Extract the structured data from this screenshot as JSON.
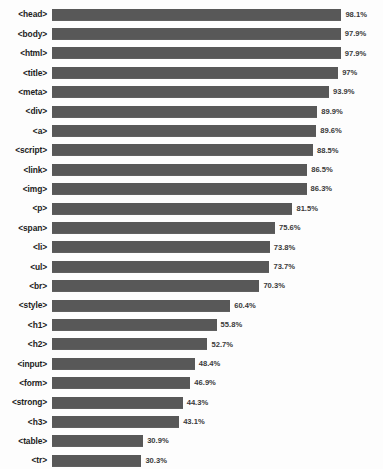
{
  "chart_data": {
    "type": "bar",
    "orientation": "horizontal",
    "title": "",
    "subtitle": "",
    "xlabel": "",
    "ylabel": "",
    "xlim": [
      0,
      100
    ],
    "grid": false,
    "legend": "none",
    "bar_color": "#585858",
    "background_color": "#fdfdfd",
    "value_suffix": "%",
    "categories": [
      "<head>",
      "<body>",
      "<html>",
      "<title>",
      "<meta>",
      "<div>",
      "<a>",
      "<script>",
      "<link>",
      "<img>",
      "<p>",
      "<span>",
      "<li>",
      "<ul>",
      "<br>",
      "<style>",
      "<h1>",
      "<h2>",
      "<input>",
      "<form>",
      "<strong>",
      "<h3>",
      "<table>",
      "<tr>",
      "<td>"
    ],
    "values": [
      98.1,
      97.9,
      97.9,
      97.0,
      93.9,
      89.9,
      89.6,
      88.5,
      86.5,
      86.3,
      81.5,
      75.6,
      73.8,
      73.7,
      70.3,
      60.4,
      55.8,
      52.7,
      48.4,
      46.9,
      44.3,
      43.1,
      30.9,
      30.3,
      30.2
    ],
    "value_labels": [
      "98.1%",
      "97.9%",
      "97.9%",
      "97%",
      "93.9%",
      "89.9%",
      "89.6%",
      "88.5%",
      "86.5%",
      "86.3%",
      "81.5%",
      "75.6%",
      "73.8%",
      "73.7%",
      "70.3%",
      "60.4%",
      "55.8%",
      "52.7%",
      "48.4%",
      "46.9%",
      "44.3%",
      "43.1%",
      "30.9%",
      "30.3%",
      "30.2%"
    ],
    "rows": [
      {
        "label": "<head>",
        "value": 98.1,
        "value_label": "98.1%"
      },
      {
        "label": "<body>",
        "value": 97.9,
        "value_label": "97.9%"
      },
      {
        "label": "<html>",
        "value": 97.9,
        "value_label": "97.9%"
      },
      {
        "label": "<title>",
        "value": 97.0,
        "value_label": "97%"
      },
      {
        "label": "<meta>",
        "value": 93.9,
        "value_label": "93.9%"
      },
      {
        "label": "<div>",
        "value": 89.9,
        "value_label": "89.9%"
      },
      {
        "label": "<a>",
        "value": 89.6,
        "value_label": "89.6%"
      },
      {
        "label": "<script>",
        "value": 88.5,
        "value_label": "88.5%"
      },
      {
        "label": "<link>",
        "value": 86.5,
        "value_label": "86.5%"
      },
      {
        "label": "<img>",
        "value": 86.3,
        "value_label": "86.3%"
      },
      {
        "label": "<p>",
        "value": 81.5,
        "value_label": "81.5%"
      },
      {
        "label": "<span>",
        "value": 75.6,
        "value_label": "75.6%"
      },
      {
        "label": "<li>",
        "value": 73.8,
        "value_label": "73.8%"
      },
      {
        "label": "<ul>",
        "value": 73.7,
        "value_label": "73.7%"
      },
      {
        "label": "<br>",
        "value": 70.3,
        "value_label": "70.3%"
      },
      {
        "label": "<style>",
        "value": 60.4,
        "value_label": "60.4%"
      },
      {
        "label": "<h1>",
        "value": 55.8,
        "value_label": "55.8%"
      },
      {
        "label": "<h2>",
        "value": 52.7,
        "value_label": "52.7%"
      },
      {
        "label": "<input>",
        "value": 48.4,
        "value_label": "48.4%"
      },
      {
        "label": "<form>",
        "value": 46.9,
        "value_label": "46.9%"
      },
      {
        "label": "<strong>",
        "value": 44.3,
        "value_label": "44.3%"
      },
      {
        "label": "<h3>",
        "value": 43.1,
        "value_label": "43.1%"
      },
      {
        "label": "<table>",
        "value": 30.9,
        "value_label": "30.9%"
      },
      {
        "label": "<tr>",
        "value": 30.3,
        "value_label": "30.3%"
      },
      {
        "label": "<td>",
        "value": 30.2,
        "value_label": "30.2%"
      }
    ]
  }
}
